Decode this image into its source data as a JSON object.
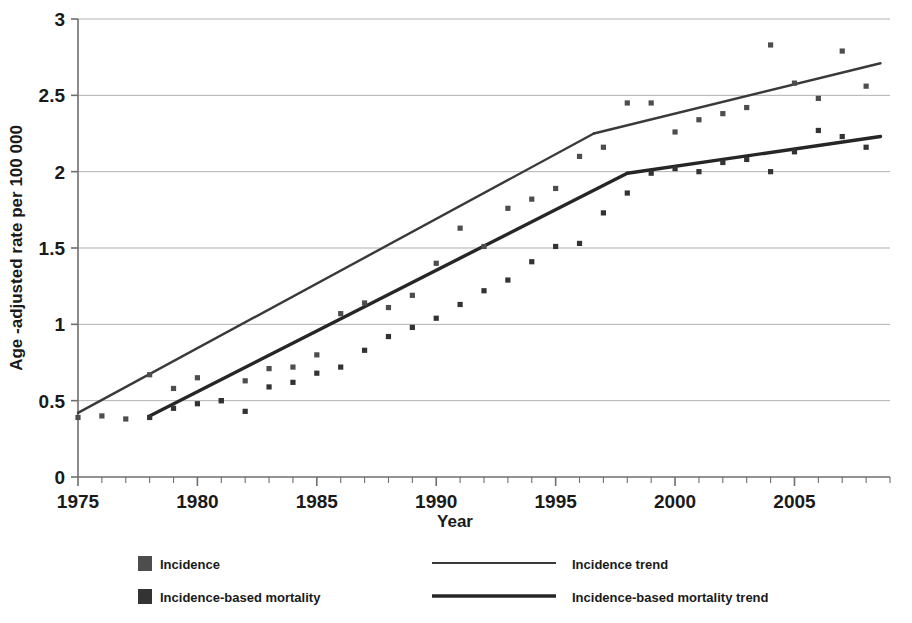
{
  "chart_data": {
    "type": "scatter",
    "title": "",
    "xlabel": "Year",
    "ylabel": "Age -adjusted rate per 100 000",
    "xlim": [
      1975,
      2009
    ],
    "ylim": [
      0,
      3
    ],
    "xticks": [
      1975,
      1980,
      1985,
      1990,
      1995,
      2000,
      2005
    ],
    "xticklabels": [
      "1975",
      "1980",
      "1985",
      "1990",
      "1995",
      "2000",
      "2005"
    ],
    "yticks": [
      0,
      0.5,
      1,
      1.5,
      2,
      2.5,
      3
    ],
    "yticklabels": [
      "0",
      "0.5",
      "1",
      "1.5",
      "2",
      "2.5",
      "3"
    ],
    "x_minor_tick_interval": 1,
    "grid": "horizontal",
    "legend_position": "below",
    "series": [
      {
        "name": "Incidence",
        "kind": "scatter",
        "marker": "square",
        "color": "#4d4d4d",
        "x": [
          1975,
          1976,
          1977,
          1978,
          1979,
          1980,
          1981,
          1982,
          1983,
          1984,
          1985,
          1986,
          1987,
          1988,
          1989,
          1990,
          1991,
          1992,
          1993,
          1994,
          1995,
          1996,
          1997,
          1998,
          1999,
          2000,
          2001,
          2002,
          2003,
          2004,
          2005,
          2006,
          2007,
          2008
        ],
        "values": [
          0.39,
          0.4,
          0.38,
          0.67,
          0.58,
          0.65,
          0.5,
          0.63,
          0.71,
          0.72,
          0.8,
          1.07,
          1.14,
          1.11,
          1.19,
          1.4,
          1.63,
          1.51,
          1.76,
          1.82,
          1.89,
          2.1,
          2.16,
          2.45,
          2.45,
          2.26,
          2.34,
          2.38,
          2.42,
          2.83,
          2.58,
          2.48,
          2.79,
          2.56
        ]
      },
      {
        "name": "Incidence-based mortality",
        "kind": "scatter",
        "marker": "square",
        "color": "#333333",
        "x": [
          1978,
          1979,
          1980,
          1981,
          1982,
          1983,
          1984,
          1985,
          1986,
          1987,
          1988,
          1989,
          1990,
          1991,
          1992,
          1993,
          1994,
          1995,
          1996,
          1997,
          1998,
          1999,
          2000,
          2001,
          2002,
          2003,
          2004,
          2005,
          2006,
          2007,
          2008
        ],
        "values": [
          0.39,
          0.45,
          0.48,
          0.5,
          0.43,
          0.59,
          0.62,
          0.68,
          0.72,
          0.83,
          0.92,
          0.98,
          1.04,
          1.13,
          1.22,
          1.29,
          1.41,
          1.51,
          1.53,
          1.73,
          1.86,
          1.99,
          2.02,
          2.0,
          2.06,
          2.08,
          2.0,
          2.13,
          2.27,
          2.23,
          2.16
        ]
      },
      {
        "name": "Incidence trend",
        "kind": "line",
        "width": "thin",
        "color": "#3a3a3a",
        "segments": [
          {
            "x": [
              1975,
              1996.6
            ],
            "y": [
              0.42,
              2.25
            ]
          },
          {
            "x": [
              1996.6,
              2008.6
            ],
            "y": [
              2.25,
              2.71
            ]
          }
        ]
      },
      {
        "name": "Incidence-based mortality trend",
        "kind": "line",
        "width": "thick",
        "color": "#262626",
        "segments": [
          {
            "x": [
              1978,
              1998.0
            ],
            "y": [
              0.4,
              1.99
            ]
          },
          {
            "x": [
              1998.0,
              2008.6
            ],
            "y": [
              1.99,
              2.23
            ]
          }
        ]
      }
    ],
    "legend": [
      {
        "label": "Incidence",
        "marker": "square",
        "color": "#4d4d4d"
      },
      {
        "label": "Incidence trend",
        "marker": "line-thin",
        "color": "#3a3a3a"
      },
      {
        "label": "Incidence-based mortality",
        "marker": "square",
        "color": "#333333"
      },
      {
        "label": "Incidence-based mortality trend",
        "marker": "line-thick",
        "color": "#262626"
      }
    ],
    "colors": {
      "grid": "#b0b0b0",
      "axis": "#6e6e6e",
      "text": "#1a1a1a",
      "background": "#ffffff"
    }
  }
}
